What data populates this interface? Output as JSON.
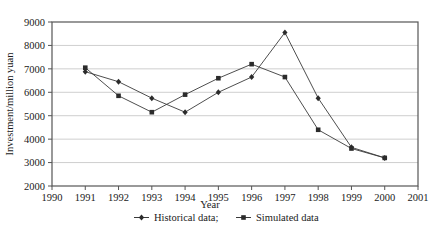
{
  "chart_data": {
    "type": "line",
    "title": "",
    "xlabel": "Year",
    "ylabel": "Investment/million yuan",
    "xlim": [
      1990,
      2001
    ],
    "ylim": [
      2000,
      9000
    ],
    "grid": true,
    "legend_position": "bottom",
    "x_ticks": [
      "1990",
      "1991",
      "1992",
      "1993",
      "1994",
      "1995",
      "1996",
      "1997",
      "1998",
      "1999",
      "2000",
      "2001"
    ],
    "y_ticks": [
      "2000",
      "3000",
      "4000",
      "5000",
      "6000",
      "7000",
      "8000",
      "9000"
    ],
    "x": [
      1991,
      1992,
      1993,
      1994,
      1995,
      1996,
      1997,
      1998,
      1999,
      2000
    ],
    "series": [
      {
        "name": "Historical data;",
        "marker": "diamond",
        "values": [
          6880,
          6450,
          5750,
          5150,
          6000,
          6650,
          8550,
          5750,
          3650,
          3200
        ]
      },
      {
        "name": "Simulated data",
        "marker": "square",
        "values": [
          7050,
          5850,
          5150,
          5900,
          6600,
          7200,
          6650,
          4400,
          3600,
          3200
        ]
      }
    ]
  },
  "legend": {
    "items": [
      {
        "label": "Historical data;"
      },
      {
        "label": "Simulated data"
      }
    ]
  },
  "colors": {
    "line": "#3a3a3a",
    "grid": "#b9b9b9",
    "axis": "#555555",
    "background": "#ffffff"
  }
}
